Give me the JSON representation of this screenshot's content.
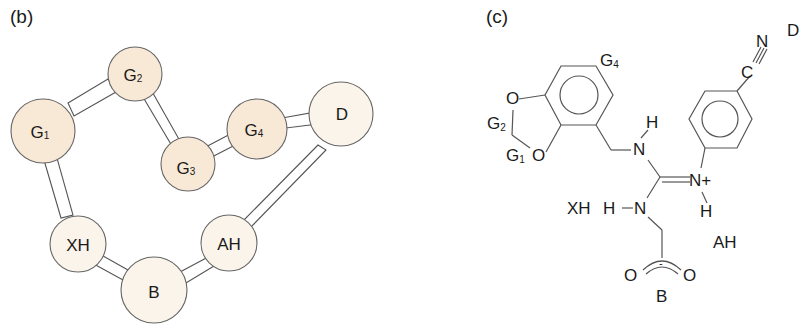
{
  "panel_b": {
    "label": "(b)",
    "colors": {
      "group_fill": "#f8e8d6",
      "site_fill": "#fbf4ea",
      "outline": "#666666"
    },
    "nodes": [
      {
        "id": "G1",
        "base": "G",
        "sub": "1",
        "type": "group"
      },
      {
        "id": "G2",
        "base": "G",
        "sub": "2",
        "type": "group"
      },
      {
        "id": "G3",
        "base": "G",
        "sub": "3",
        "type": "group"
      },
      {
        "id": "G4",
        "base": "G",
        "sub": "4",
        "type": "group"
      },
      {
        "id": "D",
        "base": "D",
        "sub": "",
        "type": "site"
      },
      {
        "id": "XH",
        "base": "XH",
        "sub": "",
        "type": "site"
      },
      {
        "id": "B",
        "base": "B",
        "sub": "",
        "type": "site"
      },
      {
        "id": "AH",
        "base": "AH",
        "sub": "",
        "type": "site"
      }
    ],
    "edges": [
      [
        "G1",
        "G2"
      ],
      [
        "G2",
        "G3"
      ],
      [
        "G3",
        "G4"
      ],
      [
        "G4",
        "D"
      ],
      [
        "D",
        "AH"
      ],
      [
        "AH",
        "B"
      ],
      [
        "B",
        "XH"
      ],
      [
        "XH",
        "G1"
      ]
    ]
  },
  "panel_c": {
    "label": "(c)",
    "labels": {
      "g4": {
        "base": "G",
        "sub": "4"
      },
      "g2": {
        "base": "G",
        "sub": "2"
      },
      "g1": {
        "base": "G",
        "sub": "1"
      },
      "o_top": "O",
      "o_bottom": "O",
      "h_top": "H",
      "n_top": "N",
      "n_plus": "N+",
      "h_right": "H",
      "xh": "XH",
      "h_left": "H",
      "n_left": "N",
      "ah": "AH",
      "o_left": "O",
      "o_right": "O",
      "minus": "-",
      "b": "B",
      "c_nitrile": "C",
      "n_nitrile": "N",
      "d": "D"
    }
  }
}
